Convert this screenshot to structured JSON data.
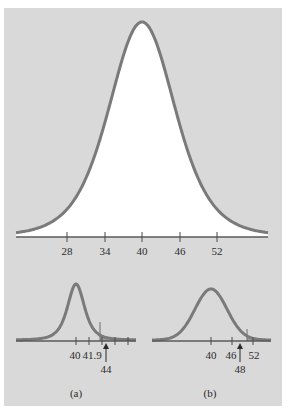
{
  "colors": {
    "background": "#d9d9d9",
    "curve": "#7a7a7a",
    "axis": "#5a5a5a",
    "fill_under_main": "#ffffff",
    "shade": "#9a9a9a"
  },
  "main": {
    "ticks": [
      "28",
      "34",
      "40",
      "46",
      "52"
    ]
  },
  "panel_a": {
    "caption": "(a)",
    "tick_labels": [
      "40",
      "41.9"
    ],
    "arrow_label": "44"
  },
  "panel_b": {
    "caption": "(b)",
    "tick_labels": [
      "40",
      "46",
      "52"
    ],
    "arrow_label": "48"
  },
  "chart_data": [
    {
      "type": "line",
      "title": "",
      "description": "Normal sampling distribution curve centered at 40, area under curve white",
      "xlabel": "",
      "ylabel": "",
      "x_ticks": [
        28,
        34,
        40,
        46,
        52
      ],
      "mean": 40,
      "sd": 6,
      "grid": false
    },
    {
      "type": "line",
      "title": "(a)",
      "description": "Narrow normal curve centered at 40 with shaded right tail; critical value 41.9, observed value 44 marked with arrow",
      "x_ticks": [
        40,
        41.9
      ],
      "mean": 40,
      "critical_value": 41.9,
      "observed_value": 44,
      "shaded_region": "right tail",
      "grid": false
    },
    {
      "type": "line",
      "title": "(b)",
      "description": "Wider normal curve centered at 40 with shaded right tail beyond ~52; observed value 48 marked with arrow",
      "x_ticks": [
        40,
        46,
        52
      ],
      "mean": 40,
      "observed_value": 48,
      "shaded_region": "right tail",
      "grid": false
    }
  ]
}
